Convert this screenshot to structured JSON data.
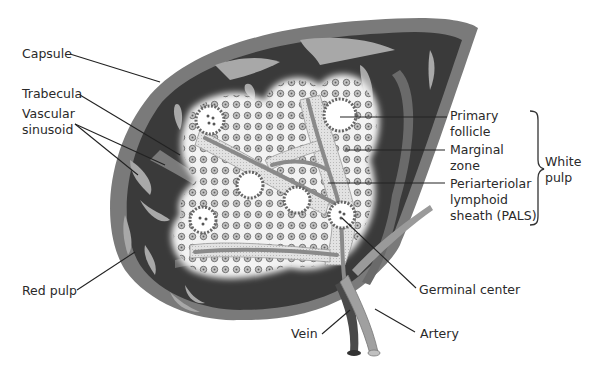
{
  "figure": {
    "colors": {
      "background": "#ffffff",
      "capsule": "#7a7a7a",
      "red_pulp": "#3a3a3a",
      "sinusoid": "#a8a8a8",
      "white_pulp": "#f2f2f2",
      "pals": "#d6d6d6",
      "artery": "#a0a0a0",
      "vein": "#4a4a4a",
      "leader_line": "#222222",
      "label_text": "#2a2a2a"
    }
  },
  "labels": {
    "capsule": "Capsule",
    "trabecula": "Trabecula",
    "vascular_sinusoid_1": "Vascular",
    "vascular_sinusoid_2": "sinusoid",
    "red_pulp": "Red pulp",
    "primary_follicle_1": "Primary",
    "primary_follicle_2": "follicle",
    "marginal_zone_1": "Marginal",
    "marginal_zone_2": "zone",
    "pals_1": "Periarteriolar",
    "pals_2": "lymphoid",
    "pals_3": "sheath (PALS)",
    "white_pulp_1": "White",
    "white_pulp_2": "pulp",
    "germinal_center": "Germinal center",
    "vein": "Vein",
    "artery": "Artery"
  }
}
